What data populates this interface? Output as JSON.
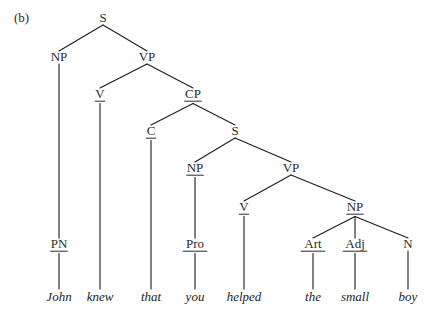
{
  "figure": {
    "label": "(b)",
    "sentence": "John knew that you helped the small boy"
  },
  "chart_data": {
    "type": "diagram",
    "diagram_kind": "syntax-tree",
    "title": "(b)",
    "nodes": [
      {
        "id": "S1",
        "label": "S",
        "x": 103,
        "y": 22,
        "underlined": false
      },
      {
        "id": "NP1",
        "label": "NP",
        "x": 59,
        "y": 61,
        "underlined": false
      },
      {
        "id": "VP1",
        "label": "VP",
        "x": 147,
        "y": 61,
        "underlined": false
      },
      {
        "id": "V1",
        "label": "V",
        "x": 100,
        "y": 98,
        "underlined": true
      },
      {
        "id": "CP1",
        "label": "CP",
        "x": 193,
        "y": 98,
        "underlined": true
      },
      {
        "id": "C1",
        "label": "C",
        "x": 151,
        "y": 135,
        "underlined": true
      },
      {
        "id": "S2",
        "label": "S",
        "x": 235,
        "y": 135,
        "underlined": false
      },
      {
        "id": "NP2",
        "label": "NP",
        "x": 195,
        "y": 172,
        "underlined": true
      },
      {
        "id": "VP2",
        "label": "VP",
        "x": 291,
        "y": 172,
        "underlined": false
      },
      {
        "id": "V2",
        "label": "V",
        "x": 244,
        "y": 211,
        "underlined": true
      },
      {
        "id": "NP3",
        "label": "NP",
        "x": 355,
        "y": 211,
        "underlined": true
      },
      {
        "id": "PN1",
        "label": "PN",
        "x": 59,
        "y": 248,
        "underlined": true
      },
      {
        "id": "Pro1",
        "label": "Pro",
        "x": 195,
        "y": 248,
        "underlined": true
      },
      {
        "id": "Art1",
        "label": "Art",
        "x": 313,
        "y": 248,
        "underlined": true
      },
      {
        "id": "Adj1",
        "label": "Adj",
        "x": 355,
        "y": 248,
        "underlined": true
      },
      {
        "id": "N1",
        "label": "N",
        "x": 408,
        "y": 248,
        "underlined": false
      }
    ],
    "edges": [
      {
        "from": "S1",
        "to": "NP1"
      },
      {
        "from": "S1",
        "to": "VP1"
      },
      {
        "from": "VP1",
        "to": "V1"
      },
      {
        "from": "VP1",
        "to": "CP1"
      },
      {
        "from": "CP1",
        "to": "C1"
      },
      {
        "from": "CP1",
        "to": "S2"
      },
      {
        "from": "S2",
        "to": "NP2"
      },
      {
        "from": "S2",
        "to": "VP2"
      },
      {
        "from": "VP2",
        "to": "V2"
      },
      {
        "from": "VP2",
        "to": "NP3"
      },
      {
        "from": "NP1",
        "to": "PN1"
      },
      {
        "from": "NP2",
        "to": "Pro1"
      },
      {
        "from": "NP3",
        "to": "Art1"
      },
      {
        "from": "NP3",
        "to": "Adj1"
      },
      {
        "from": "NP3",
        "to": "N1"
      }
    ],
    "leaves": [
      {
        "id": "w-john",
        "word": "John",
        "parent": "PN1",
        "x": 59,
        "y": 301
      },
      {
        "id": "w-knew",
        "word": "knew",
        "parent": "V1",
        "x": 100,
        "y": 301
      },
      {
        "id": "w-that",
        "word": "that",
        "parent": "C1",
        "x": 151,
        "y": 301
      },
      {
        "id": "w-you",
        "word": "you",
        "parent": "Pro1",
        "x": 195,
        "y": 301
      },
      {
        "id": "w-helped",
        "word": "helped",
        "parent": "V2",
        "x": 244,
        "y": 301
      },
      {
        "id": "w-the",
        "word": "the",
        "parent": "Art1",
        "x": 313,
        "y": 301
      },
      {
        "id": "w-small",
        "word": "small",
        "parent": "Adj1",
        "x": 355,
        "y": 301
      },
      {
        "id": "w-boy",
        "word": "boy",
        "parent": "N1",
        "x": 408,
        "y": 301
      }
    ],
    "colors": {
      "background": "#ffffff",
      "line": "#1c1c1c",
      "text": "#2b2b2b",
      "word_text": "#1c1c1c"
    }
  }
}
